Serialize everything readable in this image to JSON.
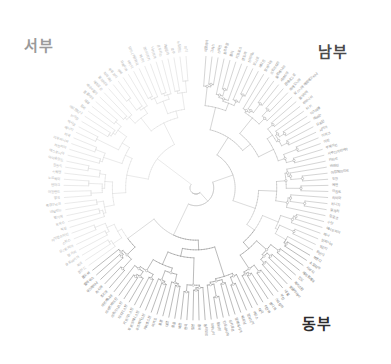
{
  "figure": {
    "type": "radial-dendrogram",
    "background": "#ffffff",
    "width": 391,
    "height": 364,
    "center": {
      "x": 196,
      "y": 188
    },
    "leaf_radius": 132,
    "label_radius": 136
  },
  "regions": [
    {
      "id": "west",
      "label": "서부",
      "color": "#9a9a9a",
      "x": 24,
      "y": 34
    },
    {
      "id": "south",
      "label": "남부",
      "color": "#4a4a4a",
      "x": 318,
      "y": 40
    },
    {
      "id": "east",
      "label": "동부",
      "color": "#2d2d2d",
      "x": 302,
      "y": 312
    }
  ],
  "style": {
    "branch_color_west": "#dcdcdc",
    "branch_color_south": "#b8b8b8",
    "branch_color_east": "#8d8d8d",
    "branch_color_core": "#c4c4c4",
    "node_marker_stroke": "#9b9b9b",
    "node_marker_fill": "#ffffff",
    "leaf_font_size": 3.4,
    "branch_width": 0.6
  },
  "chart_data": {
    "type": "tree",
    "title": "",
    "xlabel": "",
    "ylabel": "",
    "legend": [
      "서부",
      "남부",
      "동부"
    ],
    "leaf_count": 132,
    "leaves": [
      {
        "label": "이탈리아",
        "group": "south"
      },
      {
        "label": "그리스",
        "group": "south"
      },
      {
        "label": "스페인",
        "group": "south"
      },
      {
        "label": "포르투갈",
        "group": "south"
      },
      {
        "label": "몰타",
        "group": "south"
      },
      {
        "label": "키프로스",
        "group": "south"
      },
      {
        "label": "안도라",
        "group": "south"
      },
      {
        "label": "산마리노",
        "group": "south"
      },
      {
        "label": "모나코",
        "group": "south"
      },
      {
        "label": "바티칸",
        "group": "south"
      },
      {
        "label": "알바니아",
        "group": "south"
      },
      {
        "label": "크로아티아",
        "group": "south"
      },
      {
        "label": "슬로베니아",
        "group": "south"
      },
      {
        "label": "세르비아",
        "group": "south"
      },
      {
        "label": "몬테네그로",
        "group": "south"
      },
      {
        "label": "마케도니아",
        "group": "south"
      },
      {
        "label": "보스니아 헤르체고비나",
        "group": "south"
      },
      {
        "label": "불가리아",
        "group": "south"
      },
      {
        "label": "루마니아",
        "group": "south"
      },
      {
        "label": "터키",
        "group": "south"
      },
      {
        "label": "이스라엘",
        "group": "south"
      },
      {
        "label": "레바논",
        "group": "south"
      },
      {
        "label": "요르단",
        "group": "south"
      },
      {
        "label": "시리아",
        "group": "south"
      },
      {
        "label": "이라크",
        "group": "south"
      },
      {
        "label": "이란",
        "group": "south"
      },
      {
        "label": "쿠웨이트",
        "group": "south"
      },
      {
        "label": "사우디아라비아",
        "group": "south"
      },
      {
        "label": "카타르",
        "group": "south"
      },
      {
        "label": "바레인",
        "group": "south"
      },
      {
        "label": "아랍에미리트",
        "group": "south"
      },
      {
        "label": "오만",
        "group": "south"
      },
      {
        "label": "예멘",
        "group": "south"
      },
      {
        "label": "이집트",
        "group": "south"
      },
      {
        "label": "리비아",
        "group": "south"
      },
      {
        "label": "튀니지",
        "group": "south"
      },
      {
        "label": "알제리",
        "group": "south"
      },
      {
        "label": "모로코",
        "group": "south"
      },
      {
        "label": "수단",
        "group": "south"
      },
      {
        "label": "에티오피아",
        "group": "south"
      },
      {
        "label": "케냐",
        "group": "south"
      },
      {
        "label": "탄자니아",
        "group": "south"
      },
      {
        "label": "우간다",
        "group": "south"
      },
      {
        "label": "르완다",
        "group": "south"
      },
      {
        "label": "부룬디",
        "group": "east"
      },
      {
        "label": "소말리아",
        "group": "east"
      },
      {
        "label": "지부티",
        "group": "east"
      },
      {
        "label": "에리트레아",
        "group": "east"
      },
      {
        "label": "인도",
        "group": "east"
      },
      {
        "label": "파키스탄",
        "group": "east"
      },
      {
        "label": "방글라데시",
        "group": "east"
      },
      {
        "label": "네팔",
        "group": "east"
      },
      {
        "label": "부탄",
        "group": "east"
      },
      {
        "label": "스리랑카",
        "group": "east"
      },
      {
        "label": "몰디브",
        "group": "east"
      },
      {
        "label": "미얀마",
        "group": "east"
      },
      {
        "label": "태국",
        "group": "east"
      },
      {
        "label": "라오스",
        "group": "east"
      },
      {
        "label": "캄보디아",
        "group": "east"
      },
      {
        "label": "베트남",
        "group": "east"
      },
      {
        "label": "말레이시아",
        "group": "east"
      },
      {
        "label": "싱가포르",
        "group": "east"
      },
      {
        "label": "인도네시아",
        "group": "east"
      },
      {
        "label": "필리핀",
        "group": "east"
      },
      {
        "label": "브루나이",
        "group": "east"
      },
      {
        "label": "동티모르",
        "group": "east"
      },
      {
        "label": "중국",
        "group": "east"
      },
      {
        "label": "일본",
        "group": "east"
      },
      {
        "label": "한국",
        "group": "east"
      },
      {
        "label": "북한",
        "group": "east"
      },
      {
        "label": "몽골",
        "group": "east"
      },
      {
        "label": "대만",
        "group": "east"
      },
      {
        "label": "홍콩",
        "group": "east"
      },
      {
        "label": "마카오",
        "group": "east"
      },
      {
        "label": "카자흐스탄",
        "group": "east"
      },
      {
        "label": "우즈베키스탄",
        "group": "east"
      },
      {
        "label": "투르크메니스탄",
        "group": "east"
      },
      {
        "label": "키르기스스탄",
        "group": "east"
      },
      {
        "label": "타지키스탄",
        "group": "east"
      },
      {
        "label": "아프가니스탄",
        "group": "east"
      },
      {
        "label": "아제르바이잔",
        "group": "east"
      },
      {
        "label": "아르메니아",
        "group": "east"
      },
      {
        "label": "조지아",
        "group": "east"
      },
      {
        "label": "러시아",
        "group": "east"
      },
      {
        "label": "우크라이나",
        "group": "east"
      },
      {
        "label": "벨라루스",
        "group": "east"
      },
      {
        "label": "몰도바",
        "group": "east"
      },
      {
        "label": "폴란드",
        "group": "west"
      },
      {
        "label": "체코",
        "group": "west"
      },
      {
        "label": "슬로바키아",
        "group": "west"
      },
      {
        "label": "헝가리",
        "group": "west"
      },
      {
        "label": "오스트리아",
        "group": "west"
      },
      {
        "label": "스위스",
        "group": "west"
      },
      {
        "label": "리히텐슈타인",
        "group": "west"
      },
      {
        "label": "독일",
        "group": "west"
      },
      {
        "label": "프랑스",
        "group": "west"
      },
      {
        "label": "벨기에",
        "group": "west"
      },
      {
        "label": "네덜란드",
        "group": "west"
      },
      {
        "label": "룩셈부르크",
        "group": "west"
      },
      {
        "label": "영국",
        "group": "west"
      },
      {
        "label": "아일랜드",
        "group": "west"
      },
      {
        "label": "덴마크",
        "group": "west"
      },
      {
        "label": "노르웨이",
        "group": "west"
      },
      {
        "label": "스웨덴",
        "group": "west"
      },
      {
        "label": "핀란드",
        "group": "west"
      },
      {
        "label": "아이슬란드",
        "group": "west"
      },
      {
        "label": "에스토니아",
        "group": "west"
      },
      {
        "label": "라트비아",
        "group": "west"
      },
      {
        "label": "리투아니아",
        "group": "west"
      },
      {
        "label": "미국",
        "group": "west"
      },
      {
        "label": "캐나다",
        "group": "west"
      },
      {
        "label": "멕시코",
        "group": "west"
      },
      {
        "label": "브라질",
        "group": "west"
      },
      {
        "label": "아르헨티나",
        "group": "west"
      },
      {
        "label": "칠레",
        "group": "west"
      },
      {
        "label": "페루",
        "group": "west"
      },
      {
        "label": "콜롬비아",
        "group": "west"
      },
      {
        "label": "베네수엘라",
        "group": "west"
      },
      {
        "label": "에콰도르",
        "group": "west"
      },
      {
        "label": "볼리비아",
        "group": "west"
      },
      {
        "label": "파라과이",
        "group": "west"
      },
      {
        "label": "우루과이",
        "group": "west"
      },
      {
        "label": "쿠바",
        "group": "west"
      },
      {
        "label": "자메이카",
        "group": "west"
      },
      {
        "label": "아이티",
        "group": "west"
      },
      {
        "label": "도미니카공화국",
        "group": "west"
      },
      {
        "label": "파나마",
        "group": "west"
      },
      {
        "label": "코스타리카",
        "group": "west"
      },
      {
        "label": "니카라과",
        "group": "west"
      },
      {
        "label": "온두라스",
        "group": "west"
      },
      {
        "label": "과테말라",
        "group": "west"
      },
      {
        "label": "호주",
        "group": "west"
      },
      {
        "label": "뉴질랜드",
        "group": "west"
      },
      {
        "label": "피지",
        "group": "west"
      }
    ]
  }
}
